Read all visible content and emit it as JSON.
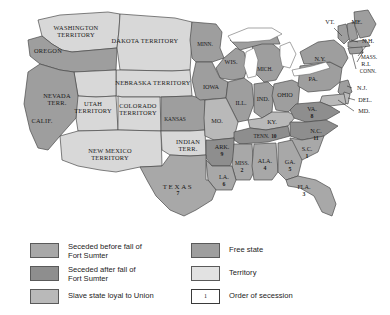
{
  "map": {
    "title": "Secession of the Southern States, 1860-1861",
    "territories": [
      {
        "name": "WASHINGTON TERRITORY",
        "lines": [
          "WASHINGTON",
          "TERRITORY"
        ],
        "x": 76,
        "y": 32,
        "class": "territory"
      },
      {
        "name": "OREGON",
        "lines": [
          "OREGON"
        ],
        "x": 48,
        "y": 52,
        "class": "free"
      },
      {
        "name": "DAKOTA TERRITORY",
        "lines": [
          "DAKOTA TERRITORY"
        ],
        "x": 145,
        "y": 42,
        "class": "territory"
      },
      {
        "name": "NEBRASKA TERRITORY",
        "lines": [
          "NEBRASKA TERRITORY"
        ],
        "x": 153,
        "y": 84,
        "class": "territory"
      },
      {
        "name": "NEVADA TERR.",
        "lines": [
          "NEVADA",
          "TERR."
        ],
        "x": 57,
        "y": 100,
        "class": "territory"
      },
      {
        "name": "UTAH TERRITORY",
        "lines": [
          "UTAH",
          "TERRITORY"
        ],
        "x": 93,
        "y": 108,
        "class": "territory"
      },
      {
        "name": "COLORADO TERRITORY",
        "lines": [
          "COLORADO",
          "TERRITORY"
        ],
        "x": 138,
        "y": 110,
        "class": "territory"
      },
      {
        "name": "NEW MEXICO TERRITORY",
        "lines": [
          "NEW MEXICO",
          "TERRITORY"
        ],
        "x": 110,
        "y": 155,
        "class": "territory"
      },
      {
        "name": "INDIAN TERR.",
        "lines": [
          "INDIAN",
          "TERR."
        ],
        "x": 188,
        "y": 146,
        "class": "territory"
      },
      {
        "name": "CALIF.",
        "lines": [
          "CALIF."
        ],
        "x": 42,
        "y": 122,
        "class": "free"
      }
    ],
    "states": [
      {
        "name": "MINN.",
        "label": "MINN.",
        "x": 205,
        "y": 45,
        "class": "free"
      },
      {
        "name": "WIS.",
        "label": "WIS.",
        "x": 231,
        "y": 63,
        "class": "free"
      },
      {
        "name": "MICH.",
        "label": "MICH.",
        "x": 265,
        "y": 70,
        "class": "free"
      },
      {
        "name": "IOWA",
        "label": "IOWA",
        "x": 211,
        "y": 88,
        "class": "free"
      },
      {
        "name": "ILL.",
        "label": "ILL.",
        "x": 241,
        "y": 104,
        "class": "free"
      },
      {
        "name": "IND.",
        "label": "IND.",
        "x": 263,
        "y": 100,
        "class": "free"
      },
      {
        "name": "OHIO",
        "label": "OHIO",
        "x": 285,
        "y": 96,
        "class": "free"
      },
      {
        "name": "KANSAS",
        "label": "KANSAS",
        "x": 175,
        "y": 120,
        "class": "free"
      },
      {
        "name": "MO.",
        "label": "MO.",
        "x": 217,
        "y": 122,
        "class": "slave-loyal"
      },
      {
        "name": "KY.",
        "label": "KY.",
        "x": 272,
        "y": 123,
        "class": "slave-loyal"
      },
      {
        "name": "PA.",
        "label": "PA.",
        "x": 313,
        "y": 80,
        "class": "free"
      },
      {
        "name": "N.Y.",
        "label": "N.Y.",
        "x": 320,
        "y": 60,
        "class": "free"
      },
      {
        "name": "VT.",
        "label": "VT.",
        "x": 330,
        "y": 23,
        "class": "free"
      },
      {
        "name": "ME.",
        "label": "ME.",
        "x": 357,
        "y": 23,
        "class": "free"
      },
      {
        "name": "N.H.",
        "label": "N.H.",
        "x": 368,
        "y": 42,
        "class": "free"
      },
      {
        "name": "MASS.",
        "label": "MASS.",
        "x": 369,
        "y": 58,
        "class": "free"
      },
      {
        "name": "R.I.",
        "label": "R.I.",
        "x": 366,
        "y": 65,
        "class": "free"
      },
      {
        "name": "CONN.",
        "label": "CONN.",
        "x": 368,
        "y": 72,
        "class": "free"
      },
      {
        "name": "N.J.",
        "label": "N.J.",
        "x": 362,
        "y": 89,
        "class": "free"
      },
      {
        "name": "DEL.",
        "label": "DEL.",
        "x": 365,
        "y": 101,
        "class": "slave-loyal"
      },
      {
        "name": "MD.",
        "label": "MD.",
        "x": 364,
        "y": 112,
        "class": "slave-loyal"
      }
    ],
    "seceded_states": [
      {
        "name": "VA.",
        "label": "VA.",
        "order": "8",
        "x": 312,
        "y": 110,
        "class": "seceded-after"
      },
      {
        "name": "N.C.",
        "label": "N.C.",
        "order": "11",
        "x": 316,
        "y": 132,
        "class": "seceded-after"
      },
      {
        "name": "S.C.",
        "label": "S.C.",
        "order": "1",
        "x": 307,
        "y": 150,
        "class": "seceded-before"
      },
      {
        "name": "TENN.",
        "label": "TENN.",
        "order": "10",
        "x": 265,
        "y": 137,
        "class": "seceded-after",
        "inline": true
      },
      {
        "name": "ARK.",
        "label": "ARK.",
        "order": "9",
        "x": 222,
        "y": 148,
        "class": "seceded-after"
      },
      {
        "name": "MISS.",
        "label": "MISS.",
        "order": "2",
        "x": 242,
        "y": 164,
        "class": "seceded-before"
      },
      {
        "name": "ALA.",
        "label": "ALA.",
        "order": "4",
        "x": 265,
        "y": 162,
        "class": "seceded-before"
      },
      {
        "name": "GA.",
        "label": "GA.",
        "order": "5",
        "x": 290,
        "y": 163,
        "class": "seceded-before"
      },
      {
        "name": "LA.",
        "label": "LA.",
        "order": "6",
        "x": 224,
        "y": 178,
        "class": "seceded-before"
      },
      {
        "name": "FLA.",
        "label": "FLA.",
        "order": "3",
        "x": 304,
        "y": 188,
        "class": "seceded-before"
      },
      {
        "name": "TEXAS",
        "label": "TEXAS",
        "order": "7",
        "x": 178,
        "y": 187,
        "class": "seceded-before",
        "big": true
      }
    ]
  },
  "legend": {
    "left": [
      {
        "swatch": "s-before",
        "text": "Seceded before fall of\nFort Sumter",
        "tall": true
      },
      {
        "swatch": "s-after",
        "text": "Seceded after fall of\nFort Sumter",
        "tall": true
      },
      {
        "swatch": "s-loyal",
        "text": "Slave state loyal to Union",
        "tall": false
      }
    ],
    "right": [
      {
        "swatch": "s-free",
        "text": "Free state",
        "tall": false,
        "box_label": ""
      },
      {
        "swatch": "s-terr",
        "text": "Territory",
        "tall": false,
        "box_label": ""
      },
      {
        "swatch": "s-order",
        "text": "Order of secession",
        "tall": false,
        "box_label": "1"
      }
    ]
  },
  "colors": {
    "seceded_before": "#a8a8a8",
    "seceded_after": "#8e8e8e",
    "slave_loyal": "#b9b9b9",
    "free_state": "#9e9e9e",
    "territory": "#d8d8d8",
    "water": "#ffffff",
    "border": "#4a4a4a",
    "text": "#1a1a1a"
  }
}
